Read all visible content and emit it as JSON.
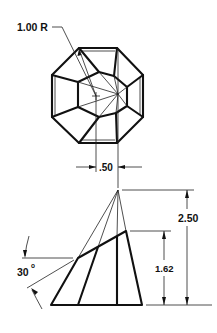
{
  "drawing": {
    "title": "Truncated polyhedral pyramid - top and front views",
    "top_view": {
      "radius_label": "1.00 R",
      "offset_label": ".50"
    },
    "front_view": {
      "height_total_label": "2.50",
      "height_cut_label": "1.62",
      "angle_label": "30",
      "angle_unit": "o"
    },
    "colors": {
      "line": "#111111",
      "background": "#ffffff"
    }
  }
}
